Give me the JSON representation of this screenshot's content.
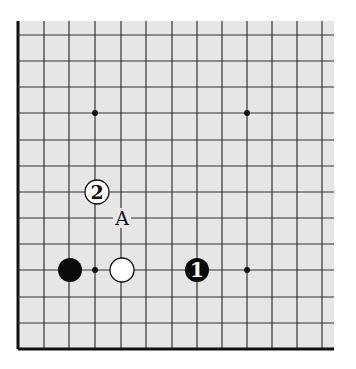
{
  "diagram": {
    "type": "go-board-fragment",
    "board_color": "#e6e6e6",
    "line_color": "#333333",
    "edge_color": "#111111",
    "grid": {
      "x": [
        18,
        44,
        69,
        95,
        121,
        146,
        172,
        197,
        222,
        247,
        272,
        297,
        322
      ],
      "y": [
        35,
        61,
        87,
        113,
        140,
        166,
        192,
        218,
        244,
        270,
        297,
        323,
        349
      ],
      "board_left": 18,
      "board_top": 21,
      "board_right": 334,
      "board_bottom": 349,
      "left_edge": true,
      "bottom_edge": true
    },
    "star_points": [
      {
        "x": 95,
        "y": 113
      },
      {
        "x": 247,
        "y": 113
      },
      {
        "x": 95,
        "y": 270
      },
      {
        "x": 247,
        "y": 270
      }
    ],
    "stones": [
      {
        "color": "black",
        "x": 70,
        "y": 270,
        "label": ""
      },
      {
        "color": "white",
        "x": 122,
        "y": 270,
        "label": ""
      },
      {
        "color": "black",
        "x": 197,
        "y": 270,
        "label": "1"
      },
      {
        "color": "white",
        "x": 97,
        "y": 192,
        "label": "2"
      }
    ],
    "marks": [
      {
        "text": "A",
        "x": 122,
        "y": 218
      }
    ]
  }
}
